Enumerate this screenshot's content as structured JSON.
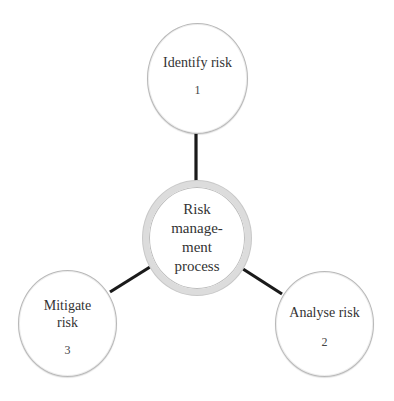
{
  "diagram": {
    "type": "hub-and-spoke",
    "center": {
      "label_lines": [
        "Risk",
        "manage-",
        "ment",
        "process"
      ]
    },
    "nodes": [
      {
        "id": "identify",
        "label_lines": [
          "Identify risk"
        ],
        "number": "1",
        "position": "top"
      },
      {
        "id": "analyse",
        "label_lines": [
          "Analyse risk"
        ],
        "number": "2",
        "position": "bottom-right"
      },
      {
        "id": "mitigate",
        "label_lines": [
          "Mitigate",
          "risk"
        ],
        "number": "3",
        "position": "bottom-left"
      }
    ],
    "edges": [
      {
        "from": "center",
        "to": "identify"
      },
      {
        "from": "center",
        "to": "analyse"
      },
      {
        "from": "center",
        "to": "mitigate"
      }
    ],
    "colors": {
      "line": "#1a1a1a",
      "node_border": "#b8b8b8",
      "center_ring": "#dcdcdc",
      "text": "#333333",
      "background": "#ffffff"
    }
  }
}
